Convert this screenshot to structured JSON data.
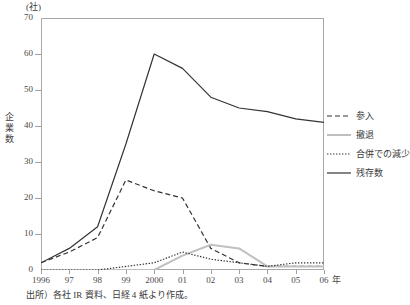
{
  "figure": {
    "unit_label": "(社)",
    "y_axis_title_chars": [
      "企",
      "業",
      "数"
    ],
    "x_axis_unit": "年",
    "source_note": "出所）各社 IR 資料、日経 4 紙より作成。"
  },
  "chart_data": {
    "type": "line",
    "title": "",
    "xlabel": "年",
    "ylabel": "企業数",
    "unit": "社",
    "grid": false,
    "legend_position": "right",
    "categories": [
      "1996",
      "97",
      "98",
      "99",
      "2000",
      "01",
      "02",
      "03",
      "04",
      "05",
      "06"
    ],
    "x_tick_labels": [
      "1996",
      "97",
      "98",
      "99",
      "2000",
      "01",
      "02",
      "03",
      "04",
      "05",
      "06"
    ],
    "y_tick_labels": [
      "0",
      "10",
      "20",
      "30",
      "40",
      "50",
      "60",
      "70"
    ],
    "ylim": [
      0,
      70
    ],
    "y_step": 10,
    "series": [
      {
        "name": "参入",
        "style": "dashed",
        "color": "#333333",
        "values": [
          2,
          5,
          9,
          25,
          22,
          20,
          6,
          2,
          1,
          1,
          1
        ]
      },
      {
        "name": "撤退",
        "style": "solid-gray",
        "color": "#c0c0c0",
        "values": [
          0,
          0,
          0,
          0,
          0,
          4,
          7,
          6,
          1,
          1,
          1
        ]
      },
      {
        "name": "合併での減少",
        "style": "dotted",
        "color": "#333333",
        "values": [
          0,
          0,
          0,
          1,
          2,
          5,
          3,
          2,
          1,
          2,
          2
        ]
      },
      {
        "name": "残存数",
        "style": "solid",
        "color": "#333333",
        "values": [
          2,
          6,
          12,
          35,
          60,
          56,
          48,
          45,
          44,
          42,
          41
        ]
      }
    ]
  },
  "legend": {
    "items": [
      {
        "label": "参入",
        "style": "dashed",
        "color": "#333333"
      },
      {
        "label": "撤退",
        "style": "solid-gray",
        "color": "#c0c0c0"
      },
      {
        "label": "合併での減少",
        "style": "dotted",
        "color": "#333333"
      },
      {
        "label": "残存数",
        "style": "solid",
        "color": "#333333"
      }
    ]
  }
}
